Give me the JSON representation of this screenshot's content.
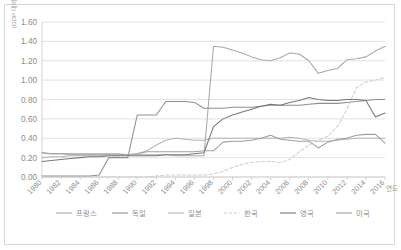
{
  "chart_data": {
    "type": "line",
    "title": "",
    "xlabel": "연도",
    "ylabel": "(GDP 대비 %)",
    "ylim": [
      0.0,
      1.6
    ],
    "ytick_labels": [
      "0.00",
      "0.20",
      "0.40",
      "0.60",
      "0.80",
      "1.00",
      "1.20",
      "1.40",
      "1.60"
    ],
    "ytick_values": [
      0.0,
      0.2,
      0.4,
      0.6,
      0.8,
      1.0,
      1.2,
      1.4,
      1.6
    ],
    "xlim": [
      1980,
      2016
    ],
    "xtick_labels": [
      "1980",
      "1982",
      "1984",
      "1986",
      "1988",
      "1990",
      "1992",
      "1994",
      "1996",
      "1998",
      "2000",
      "2002",
      "2004",
      "2006",
      "2008",
      "2010",
      "2012",
      "2014",
      "2016"
    ],
    "x": [
      1980,
      1981,
      1982,
      1983,
      1984,
      1985,
      1986,
      1987,
      1988,
      1989,
      1990,
      1991,
      1992,
      1993,
      1994,
      1995,
      1996,
      1997,
      1998,
      1999,
      2000,
      2001,
      2002,
      2003,
      2004,
      2005,
      2006,
      2007,
      2008,
      2009,
      2010,
      2011,
      2012,
      2013,
      2014,
      2015,
      2016
    ],
    "grid": "horizontal",
    "legend_position": "bottom",
    "series": [
      {
        "name": "프랑스",
        "color": "#a8a8a8",
        "style": "solid",
        "values": [
          0.25,
          0.24,
          0.24,
          0.24,
          0.24,
          0.24,
          0.24,
          0.24,
          0.24,
          0.23,
          0.23,
          0.23,
          0.23,
          0.23,
          0.22,
          0.22,
          0.22,
          0.22,
          1.35,
          1.34,
          1.31,
          1.28,
          1.24,
          1.21,
          1.2,
          1.23,
          1.28,
          1.27,
          1.2,
          1.07,
          1.1,
          1.12,
          1.21,
          1.22,
          1.24,
          1.3,
          1.35
        ]
      },
      {
        "name": "독일",
        "color": "#8f8f8f",
        "style": "solid",
        "values": [
          0.01,
          0.01,
          0.01,
          0.01,
          0.01,
          0.01,
          0.02,
          0.2,
          0.2,
          0.2,
          0.64,
          0.64,
          0.64,
          0.78,
          0.78,
          0.78,
          0.77,
          0.71,
          0.71,
          0.71,
          0.72,
          0.72,
          0.72,
          0.73,
          0.74,
          0.74,
          0.74,
          0.74,
          0.75,
          0.76,
          0.76,
          0.76,
          0.77,
          0.78,
          0.79,
          0.8,
          0.8
        ]
      },
      {
        "name": "일본",
        "color": "#b5b5b5",
        "style": "solid",
        "values": [
          0.2,
          0.21,
          0.21,
          0.22,
          0.22,
          0.22,
          0.22,
          0.22,
          0.22,
          0.23,
          0.24,
          0.27,
          0.33,
          0.38,
          0.4,
          0.39,
          0.38,
          0.38,
          0.4,
          0.4,
          0.4,
          0.4,
          0.4,
          0.4,
          0.4,
          0.4,
          0.41,
          0.4,
          0.38,
          0.37,
          0.37,
          0.38,
          0.39,
          0.4,
          0.4,
          0.4,
          0.4
        ]
      },
      {
        "name": "한국",
        "color": "#cfcfcf",
        "style": "dashed",
        "values": [
          0.0,
          0.0,
          0.0,
          0.0,
          0.0,
          0.0,
          0.0,
          0.0,
          0.0,
          0.0,
          0.0,
          0.0,
          0.01,
          0.02,
          0.02,
          0.02,
          0.02,
          0.02,
          0.03,
          0.06,
          0.1,
          0.13,
          0.15,
          0.16,
          0.16,
          0.15,
          0.18,
          0.26,
          0.33,
          0.38,
          0.42,
          0.52,
          0.7,
          0.92,
          0.98,
          1.0,
          1.03
        ]
      },
      {
        "name": "영국",
        "color": "#777777",
        "style": "solid",
        "values": [
          0.16,
          0.17,
          0.18,
          0.19,
          0.2,
          0.21,
          0.21,
          0.22,
          0.22,
          0.22,
          0.22,
          0.22,
          0.22,
          0.23,
          0.23,
          0.23,
          0.24,
          0.25,
          0.52,
          0.6,
          0.64,
          0.67,
          0.7,
          0.73,
          0.75,
          0.74,
          0.77,
          0.79,
          0.82,
          0.8,
          0.79,
          0.79,
          0.8,
          0.8,
          0.79,
          0.62,
          0.66
        ]
      },
      {
        "name": "미국",
        "color": "#9e9e9e",
        "style": "solid",
        "values": [
          0.25,
          0.24,
          0.24,
          0.23,
          0.23,
          0.23,
          0.23,
          0.23,
          0.23,
          0.23,
          0.24,
          0.26,
          0.26,
          0.26,
          0.26,
          0.26,
          0.26,
          0.27,
          0.27,
          0.36,
          0.37,
          0.37,
          0.38,
          0.4,
          0.43,
          0.39,
          0.38,
          0.37,
          0.37,
          0.3,
          0.36,
          0.39,
          0.4,
          0.43,
          0.44,
          0.44,
          0.35
        ]
      }
    ]
  }
}
